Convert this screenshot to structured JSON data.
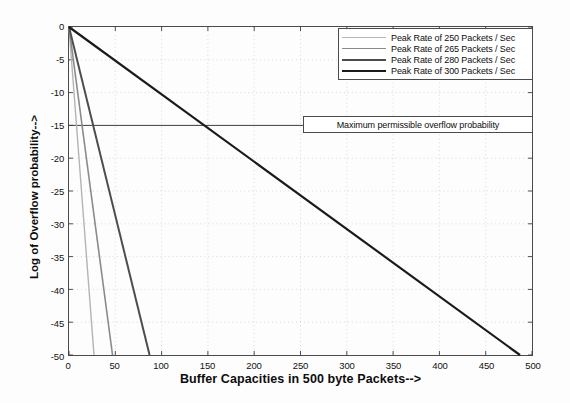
{
  "chart_data": {
    "type": "line",
    "title": "",
    "xlabel": "Buffer Capacities in 500 byte Packets-->",
    "ylabel": "Log of Overflow probability-->",
    "xlim": [
      0,
      500
    ],
    "ylim": [
      -50,
      0
    ],
    "xticks": [
      0,
      50,
      100,
      150,
      200,
      250,
      300,
      350,
      400,
      450,
      500
    ],
    "yticks": [
      0,
      -5,
      -10,
      -15,
      -20,
      -25,
      -30,
      -35,
      -40,
      -45,
      -50
    ],
    "xtick_labels": [
      "0",
      "50",
      "100",
      "150",
      "200",
      "250",
      "300",
      "350",
      "400",
      "450",
      "500"
    ],
    "ytick_labels": [
      "0",
      "-5",
      "-10",
      "-15",
      "-20",
      "-25",
      "-30",
      "-35",
      "-40",
      "-45",
      "-50"
    ],
    "grid": true,
    "grid_style": "dotted",
    "legend_position": "top-right",
    "series": [
      {
        "name": "Peak Rate of 250 Packets / Sec",
        "color": "#b4b4b4",
        "width": 1.4,
        "x": [
          0,
          27
        ],
        "y": [
          0,
          -50
        ]
      },
      {
        "name": "Peak Rate of 265 Packets / Sec",
        "color": "#8a8a8a",
        "width": 1.6,
        "x": [
          0,
          47
        ],
        "y": [
          0,
          -50
        ]
      },
      {
        "name": "Peak Rate of 280 Packets / Sec",
        "color": "#4d4d4d",
        "width": 2.0,
        "x": [
          0,
          87
        ],
        "y": [
          0,
          -50
        ]
      },
      {
        "name": "Peak Rate of 300 Packets / Sec",
        "color": "#1a1a1a",
        "width": 2.2,
        "x": [
          0,
          487
        ],
        "y": [
          0,
          -50
        ]
      }
    ],
    "annotations": [
      {
        "type": "hline",
        "label": "Maximum permissible overflow probability",
        "y": -15,
        "color": "#3d3d3d",
        "boxed": true
      }
    ]
  },
  "legend": {
    "entries": [
      "Peak Rate of 250 Packets / Sec",
      "Peak Rate of 265 Packets / Sec",
      "Peak Rate of 280 Packets / Sec",
      "Peak Rate of 300 Packets / Sec"
    ]
  },
  "annotation": {
    "text": "Maximum permissible overflow probability"
  },
  "axes": {
    "x_title": "Buffer Capacities in 500 byte Packets-->",
    "y_title": "Log of Overflow probability-->"
  }
}
